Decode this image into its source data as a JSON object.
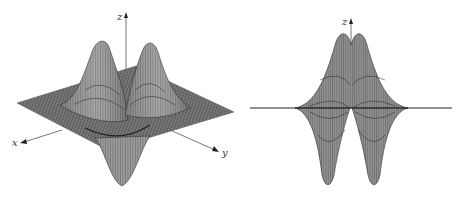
{
  "figure": {
    "colors": {
      "surface": "#8a8a8a",
      "mesh": "#2a2a2a",
      "plane": "#6e6e6e",
      "axis": "#444444",
      "background": "#ffffff"
    },
    "left_plot": {
      "view": "oblique",
      "axes": {
        "x_label": "x",
        "y_label": "y",
        "z_label": "z"
      },
      "features": {
        "peaks": [
          {
            "x": 101,
            "y": 39
          },
          {
            "x": 150,
            "y": 42
          }
        ],
        "troughs": [
          {
            "x": 122,
            "y": 185
          }
        ],
        "plane_corners": {
          "left": [
            17,
            103
          ],
          "back": [
            136,
            66
          ],
          "right": [
            234,
            112
          ],
          "front": [
            108,
            150
          ]
        }
      }
    },
    "right_plot": {
      "view": "side",
      "axes": {
        "z_label": "z"
      },
      "features": {
        "peaks": [
          {
            "x": 343,
            "y": 33
          },
          {
            "x": 358,
            "y": 33
          }
        ],
        "troughs": [
          {
            "x": 327,
            "y": 183
          },
          {
            "x": 373,
            "y": 183
          }
        ],
        "baseline_y": 108
      }
    }
  }
}
